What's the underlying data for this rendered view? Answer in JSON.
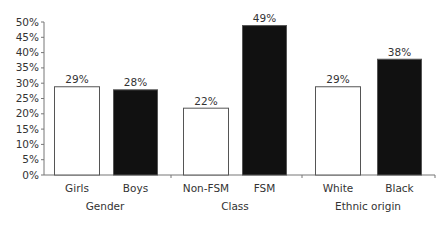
{
  "chart_data": {
    "type": "bar",
    "title": "",
    "xlabel": "",
    "ylabel": "",
    "ylim": [
      0,
      50
    ],
    "yticks": [
      "0%",
      "5%",
      "10%",
      "15%",
      "20%",
      "25%",
      "30%",
      "35%",
      "40%",
      "45%",
      "50%"
    ],
    "grid": false,
    "legend": null,
    "groups": [
      {
        "label": "Gender",
        "categories": [
          "Girls",
          "Boys"
        ],
        "values": [
          29,
          28
        ],
        "value_labels": [
          "29%",
          "28%"
        ],
        "fills": [
          "white",
          "black"
        ]
      },
      {
        "label": "Class",
        "categories": [
          "Non-FSM",
          "FSM"
        ],
        "values": [
          22,
          49
        ],
        "value_labels": [
          "22%",
          "49%"
        ],
        "fills": [
          "white",
          "black"
        ]
      },
      {
        "label": "Ethnic origin",
        "categories": [
          "White",
          "Black"
        ],
        "values": [
          29,
          38
        ],
        "value_labels": [
          "29%",
          "38%"
        ],
        "fills": [
          "white",
          "black"
        ]
      }
    ],
    "categories": [
      "Girls",
      "Boys",
      "Non-FSM",
      "FSM",
      "White",
      "Black"
    ],
    "values": [
      29,
      28,
      22,
      49,
      29,
      38
    ]
  },
  "colors": {
    "axis": "#777777",
    "bar_outline": "#555555",
    "light_fill": "#ffffff",
    "dark_fill": "#111111"
  }
}
